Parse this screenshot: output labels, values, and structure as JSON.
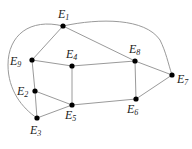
{
  "diagram": {
    "type": "graph",
    "nodes": [
      {
        "id": "E1",
        "base": "E",
        "sub": "1"
      },
      {
        "id": "E2",
        "base": "E",
        "sub": "2"
      },
      {
        "id": "E3",
        "base": "E",
        "sub": "3"
      },
      {
        "id": "E4",
        "base": "E",
        "sub": "4"
      },
      {
        "id": "E5",
        "base": "E",
        "sub": "5"
      },
      {
        "id": "E6",
        "base": "E",
        "sub": "6"
      },
      {
        "id": "E7",
        "base": "E",
        "sub": "7"
      },
      {
        "id": "E8",
        "base": "E",
        "sub": "8"
      },
      {
        "id": "E9",
        "base": "E",
        "sub": "9"
      }
    ],
    "edges": [
      [
        "E1",
        "E9"
      ],
      [
        "E1",
        "E8"
      ],
      [
        "E9",
        "E4"
      ],
      [
        "E4",
        "E8"
      ],
      [
        "E9",
        "E2"
      ],
      [
        "E2",
        "E3"
      ],
      [
        "E2",
        "E5"
      ],
      [
        "E3",
        "E5"
      ],
      [
        "E4",
        "E5"
      ],
      [
        "E5",
        "E6"
      ],
      [
        "E8",
        "E6"
      ],
      [
        "E8",
        "E7"
      ],
      [
        "E6",
        "E7"
      ]
    ],
    "curved_edges": [
      [
        "E1",
        "E3"
      ],
      [
        "E1",
        "E7"
      ]
    ]
  }
}
